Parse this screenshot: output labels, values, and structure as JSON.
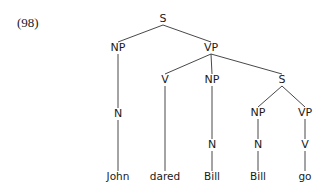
{
  "example_number": "(98)",
  "tree": {
    "nodes": [
      {
        "id": "S0",
        "label": "S",
        "x": 163,
        "y": 19
      },
      {
        "id": "NP1",
        "label": "NP",
        "x": 118,
        "y": 48
      },
      {
        "id": "VP1",
        "label": "VP",
        "x": 211,
        "y": 48
      },
      {
        "id": "N1",
        "label": "N",
        "x": 118,
        "y": 114
      },
      {
        "id": "V1",
        "label": "V",
        "x": 165,
        "y": 80
      },
      {
        "id": "NP2",
        "label": "NP",
        "x": 212,
        "y": 80
      },
      {
        "id": "S2",
        "label": "S",
        "x": 282,
        "y": 80
      },
      {
        "id": "N2",
        "label": "N",
        "x": 212,
        "y": 145
      },
      {
        "id": "NP3",
        "label": "NP",
        "x": 258,
        "y": 113
      },
      {
        "id": "VP3",
        "label": "VP",
        "x": 305,
        "y": 113
      },
      {
        "id": "N3",
        "label": "N",
        "x": 258,
        "y": 145
      },
      {
        "id": "V3",
        "label": "V",
        "x": 305,
        "y": 145
      },
      {
        "id": "L1",
        "label": "John",
        "x": 118,
        "y": 177,
        "leaf": true
      },
      {
        "id": "L2",
        "label": "dared",
        "x": 165,
        "y": 177,
        "leaf": true
      },
      {
        "id": "L3",
        "label": "Bill",
        "x": 212,
        "y": 177,
        "leaf": true
      },
      {
        "id": "L4",
        "label": "Bill",
        "x": 258,
        "y": 177,
        "leaf": true
      },
      {
        "id": "L5",
        "label": "go",
        "x": 305,
        "y": 177,
        "leaf": true
      }
    ],
    "edges": [
      [
        "S0",
        "NP1"
      ],
      [
        "S0",
        "VP1"
      ],
      [
        "NP1",
        "N1"
      ],
      [
        "N1",
        "L1"
      ],
      [
        "VP1",
        "V1"
      ],
      [
        "VP1",
        "NP2"
      ],
      [
        "VP1",
        "S2"
      ],
      [
        "V1",
        "L2"
      ],
      [
        "NP2",
        "N2"
      ],
      [
        "N2",
        "L3"
      ],
      [
        "S2",
        "NP3"
      ],
      [
        "S2",
        "VP3"
      ],
      [
        "NP3",
        "N3"
      ],
      [
        "N3",
        "L4"
      ],
      [
        "VP3",
        "V3"
      ],
      [
        "V3",
        "L5"
      ]
    ]
  }
}
